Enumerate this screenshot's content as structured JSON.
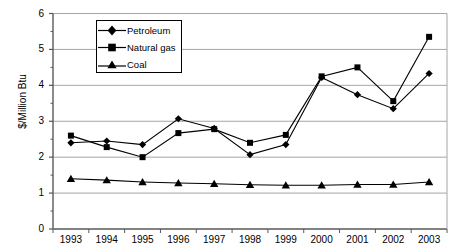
{
  "chart_data": {
    "type": "line",
    "title": "",
    "xlabel": "",
    "ylabel": "$/Million Btu",
    "categories": [
      "1993",
      "1994",
      "1995",
      "1996",
      "1997",
      "1998",
      "1999",
      "2000",
      "2001",
      "2002",
      "2003"
    ],
    "ylim": [
      0,
      6
    ],
    "y_ticks": [
      0,
      1,
      2,
      3,
      4,
      5,
      6
    ],
    "y_minor_ticks": [
      0.5,
      1.5,
      2.5,
      3.5,
      4.5,
      5.5
    ],
    "grid": "horizontal-major",
    "legend_position": "top-left-inside",
    "series": [
      {
        "name": "Petroleum",
        "marker": "diamond",
        "values": [
          2.4,
          2.45,
          2.35,
          3.07,
          2.8,
          2.07,
          2.35,
          4.22,
          3.74,
          3.35,
          4.33
        ]
      },
      {
        "name": "Natural gas",
        "marker": "square",
        "values": [
          2.6,
          2.28,
          2.0,
          2.67,
          2.78,
          2.4,
          2.62,
          4.25,
          4.5,
          3.56,
          5.35
        ]
      },
      {
        "name": "Coal",
        "marker": "triangle",
        "values": [
          1.4,
          1.36,
          1.31,
          1.28,
          1.26,
          1.23,
          1.22,
          1.22,
          1.24,
          1.24,
          1.31
        ]
      }
    ]
  },
  "colors": {
    "line": "#000000",
    "grid": "#a6a6a6",
    "axis": "#595959",
    "background": "#ffffff"
  },
  "y_axis_title": "$/Million Btu",
  "legend": {
    "items": [
      {
        "label": "Petroleum",
        "marker": "diamond"
      },
      {
        "label": "Natural gas",
        "marker": "square"
      },
      {
        "label": "Coal",
        "marker": "triangle"
      }
    ]
  }
}
